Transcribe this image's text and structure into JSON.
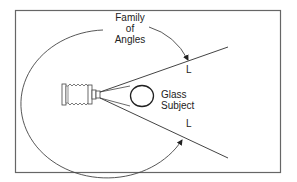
{
  "diagram": {
    "labels": {
      "family_line1": "Family",
      "family_line2": "of",
      "family_line3": "Angles",
      "glass_line1": "Glass",
      "glass_line2": "Subject",
      "upper_point": "L",
      "lower_point": "L"
    },
    "colors": {
      "stroke": "#333333",
      "frame": "#666666",
      "background": "#ffffff"
    }
  }
}
